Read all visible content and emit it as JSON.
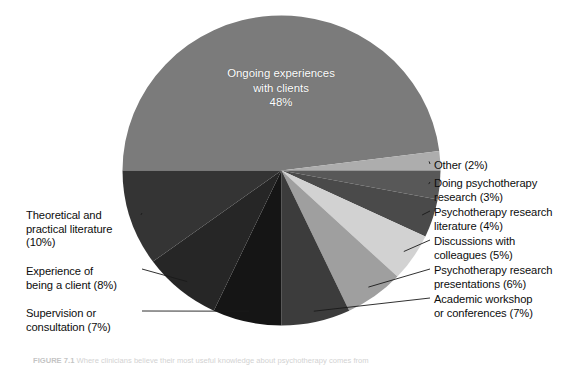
{
  "figure": {
    "caption_prefix": "FIGURE 7.1",
    "caption_text": "Where clinicians believe their most useful knowledge about psychotherapy comes from"
  },
  "center_label": {
    "line1": "Ongoing experiences",
    "line2": "with clients",
    "line3": "48%"
  },
  "chart_data": {
    "type": "pie",
    "title": "",
    "xlabel": "",
    "ylabel": "",
    "legend_position": "callout-labels",
    "grid": false,
    "total": 100,
    "units": "%",
    "start_angle_deg": 180,
    "direction": "clockwise",
    "categories": [
      "Ongoing experiences with clients",
      "Other",
      "Doing psychotherapy research",
      "Psychotherapy research literature",
      "Discussions with colleagues",
      "Psychotherapy research presentations",
      "Academic workshop or conferences",
      "Supervision or consultation",
      "Experience of being a client",
      "Theoretical and practical literature"
    ],
    "values": [
      48,
      2,
      3,
      4,
      5,
      6,
      7,
      7,
      8,
      10
    ],
    "colors": [
      "#7b7b7b",
      "#adadad",
      "#585858",
      "#4a4a4a",
      "#d2d2d2",
      "#9f9f9f",
      "#3c3c3c",
      "#151515",
      "#262626",
      "#343434"
    ],
    "slices": [
      {
        "label": "Ongoing experiences with clients",
        "value": 48,
        "display": "48%",
        "color": "#7b7b7b"
      },
      {
        "label": "Other",
        "value": 2,
        "display": "2%",
        "color": "#adadad"
      },
      {
        "label": "Doing psychotherapy research",
        "value": 3,
        "display": "3%",
        "color": "#585858"
      },
      {
        "label": "Psychotherapy research literature",
        "value": 4,
        "display": "4%",
        "color": "#4a4a4a"
      },
      {
        "label": "Discussions with colleagues",
        "value": 5,
        "display": "5%",
        "color": "#d2d2d2"
      },
      {
        "label": "Psychotherapy research presentations",
        "value": 6,
        "display": "6%",
        "color": "#9f9f9f"
      },
      {
        "label": "Academic workshop or conferences",
        "value": 7,
        "display": "7%",
        "color": "#3c3c3c"
      },
      {
        "label": "Supervision or consultation",
        "value": 7,
        "display": "7%",
        "color": "#151515"
      },
      {
        "label": "Experience of being a client",
        "value": 8,
        "display": "8%",
        "color": "#262626"
      },
      {
        "label": "Theoretical and practical literature",
        "value": 10,
        "display": "10%",
        "color": "#343434"
      }
    ]
  },
  "callouts": {
    "right": [
      {
        "name": "callout-other",
        "text": "Other (2%)"
      },
      {
        "name": "callout-doing-psychotherapy-research",
        "text": "Doing psychotherapy\nresearch (3%)"
      },
      {
        "name": "callout-psychotherapy-research-literature",
        "text": "Psychotherapy research\nliterature (4%)"
      },
      {
        "name": "callout-discussions-with-colleagues",
        "text": "Discussions with\ncolleagues (5%)"
      },
      {
        "name": "callout-psychotherapy-research-presentations",
        "text": "Psychotherapy research\npresentations (6%)"
      },
      {
        "name": "callout-academic-workshop-or-conferences",
        "text": "Academic workshop\nor conferences (7%)"
      }
    ],
    "left": [
      {
        "name": "callout-theoretical-and-practical-literature",
        "text": "Theoretical and\npractical literature\n(10%)"
      },
      {
        "name": "callout-experience-of-being-a-client",
        "text": "Experience of\nbeing a client (8%)"
      },
      {
        "name": "callout-supervision-or-consultation",
        "text": "Supervision or\nconsultation (7%)"
      }
    ]
  }
}
